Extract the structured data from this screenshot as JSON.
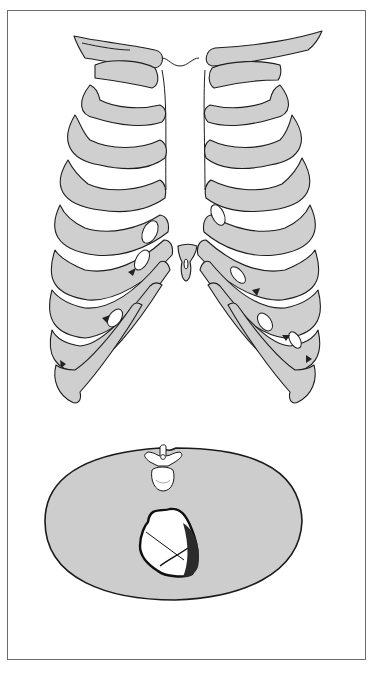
{
  "figure": {
    "top_panel": {
      "name": "anterior-thorax-ribcage",
      "leads": [
        {
          "id": "V1",
          "main": "V",
          "sub": "1",
          "x": 155,
          "y": 202
        },
        {
          "id": "V2",
          "main": "V",
          "sub": "2",
          "x": 215,
          "y": 202
        },
        {
          "id": "V3",
          "main": "V",
          "sub": "3",
          "x": 231,
          "y": 225
        },
        {
          "id": "V4",
          "main": "V",
          "sub": "4",
          "x": 247,
          "y": 247
        },
        {
          "id": "V5",
          "main": "V",
          "sub": "5",
          "x": 297,
          "y": 257
        },
        {
          "id": "V6",
          "main": "V",
          "sub": "6",
          "x": 321,
          "y": 247
        },
        {
          "id": "V6R",
          "main": "V",
          "sub": "6",
          "suffix": "R",
          "x": 60,
          "y": 242
        },
        {
          "id": "V5R",
          "main": "V",
          "sub": "5",
          "suffix": "R",
          "x": 89,
          "y": 265
        },
        {
          "id": "V4R",
          "main": "V",
          "sub": "4",
          "suffix": "R",
          "x": 125,
          "y": 247
        }
      ]
    },
    "bottom_panel": {
      "name": "transverse-chest-section",
      "labels": {
        "lv": "LV",
        "rv": "RV"
      },
      "leads": [
        {
          "id": "V1",
          "main": "V",
          "sub": "1",
          "x": 119,
          "y": 637,
          "dot_x": 143,
          "dot_y": 599
        },
        {
          "id": "V2",
          "main": "V",
          "sub": "2",
          "x": 176,
          "y": 640,
          "dot_x": 178,
          "dot_y": 601
        },
        {
          "id": "V3",
          "main": "V",
          "sub": "3",
          "x": 218,
          "y": 637,
          "dot_x": 208,
          "dot_y": 601
        },
        {
          "id": "V4",
          "main": "V",
          "sub": "4",
          "x": 264,
          "y": 624,
          "dot_x": 241,
          "dot_y": 595
        },
        {
          "id": "V5",
          "main": "V",
          "sub": "5",
          "x": 311,
          "y": 602,
          "dot_x": 272,
          "dot_y": 583
        },
        {
          "id": "V6",
          "main": "V",
          "sub": "6",
          "x": 346,
          "y": 557,
          "dot_x": 295,
          "dot_y": 556
        }
      ]
    },
    "colors": {
      "bone": "#cfcfcf",
      "outline": "#1e1e1e",
      "background": "#ffffff",
      "frame": "#6b6b6b"
    }
  }
}
